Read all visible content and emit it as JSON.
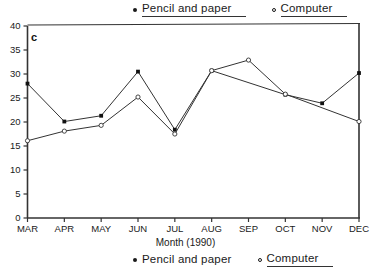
{
  "figure": {
    "panel_label": "c",
    "legend_top": [
      {
        "marker": "filled-circle-marker",
        "label": "Pencil and paper",
        "underlined": true
      },
      {
        "marker": "open-circle-marker",
        "label": "Computer",
        "underlined": true
      }
    ],
    "legend_bottom": [
      {
        "marker": "filled-circle-marker",
        "label": "Pencil and paper",
        "underlined": false
      },
      {
        "marker": "open-circle-marker",
        "label": "Computer",
        "underlined": true
      }
    ]
  },
  "chart_data": {
    "type": "line",
    "title": "",
    "xlabel": "Month (1990)",
    "ylabel": "",
    "categories": [
      "MAR",
      "APR",
      "MAY",
      "JUN",
      "JUL",
      "AUG",
      "SEP",
      "OCT",
      "NOV",
      "DEC"
    ],
    "ylim": [
      0,
      40
    ],
    "yticks": [
      0,
      5,
      10,
      15,
      20,
      25,
      30,
      35,
      40
    ],
    "grid": false,
    "legend_position": "top and bottom, outside axes",
    "series": [
      {
        "name": "Pencil and paper",
        "marker": "filled-circle",
        "values": [
          28,
          20.1,
          21.3,
          30.5,
          18.4,
          30.7,
          null,
          25.7,
          23.9,
          30.2
        ]
      },
      {
        "name": "Computer",
        "marker": "open-circle",
        "values": [
          16.1,
          18.1,
          19.3,
          25.2,
          17.5,
          30.7,
          32.9,
          25.8,
          null,
          20.1
        ]
      }
    ]
  },
  "axis": {
    "y_labels": [
      "40",
      "35",
      "30",
      "25",
      "20",
      "15",
      "10",
      "5",
      "0"
    ],
    "x_labels": [
      "MAR",
      "APR",
      "MAY",
      "JUN",
      "JUL",
      "AUG",
      "SEP",
      "OCT",
      "NOV",
      "DEC"
    ],
    "x_title": "Month (1990)"
  }
}
